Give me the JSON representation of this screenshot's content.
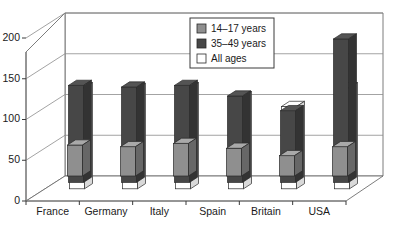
{
  "chart_data": {
    "type": "bar",
    "title": "",
    "subtitle": "",
    "xlabel": "",
    "ylabel": "",
    "categories": [
      "France",
      "Germany",
      "Italy",
      "Spain",
      "Britain",
      "USA"
    ],
    "series": [
      {
        "name": "14–17 years",
        "color": "#8f8f8f",
        "values": [
          38,
          36,
          40,
          34,
          25,
          36
        ]
      },
      {
        "name": "35–49 years",
        "color": "#474747",
        "values": [
          119,
          117,
          119,
          106,
          88,
          176
        ]
      },
      {
        "name": "All ages",
        "color": "#ffffff",
        "values": [
          124,
          123,
          124,
          113,
          101,
          124
        ]
      }
    ],
    "ylim": [
      0,
      200
    ],
    "yticks": [
      0,
      50,
      100,
      150,
      200
    ],
    "ytick_labels": [
      "0",
      "50",
      "100",
      "150",
      "200"
    ],
    "grid": true,
    "legend_position": "top-center",
    "projection": "3d"
  },
  "legend": {
    "items": [
      {
        "label": "14–17 years",
        "swatch": "gray-swatch"
      },
      {
        "label": "35–49 years",
        "swatch": "dark-swatch"
      },
      {
        "label": "All ages",
        "swatch": "white-swatch"
      }
    ]
  },
  "colors": {
    "series_young": "#8f8f8f",
    "series_mid": "#474747",
    "series_all": "#ffffff",
    "grid": "#8c8c8c",
    "axis": "#6e6e6e",
    "text": "#1a1a1a",
    "background": "#ffffff"
  }
}
